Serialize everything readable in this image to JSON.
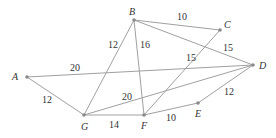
{
  "diagram": {
    "type": "weighted-undirected-graph",
    "nodes": [
      {
        "id": "A",
        "x": 27,
        "y": 77,
        "lx": 12,
        "ly": 80
      },
      {
        "id": "B",
        "x": 134,
        "y": 20,
        "lx": 129,
        "ly": 15
      },
      {
        "id": "C",
        "x": 220,
        "y": 30,
        "lx": 224,
        "ly": 28
      },
      {
        "id": "D",
        "x": 253,
        "y": 65,
        "lx": 259,
        "ly": 69
      },
      {
        "id": "E",
        "x": 198,
        "y": 103,
        "lx": 195,
        "ly": 117
      },
      {
        "id": "F",
        "x": 144,
        "y": 115,
        "lx": 141,
        "ly": 129
      },
      {
        "id": "G",
        "x": 84,
        "y": 115,
        "lx": 81,
        "ly": 130
      }
    ],
    "edges": [
      {
        "from": "A",
        "to": "D",
        "weight": "20",
        "wx": 70,
        "wy": 71
      },
      {
        "from": "A",
        "to": "G",
        "weight": "12",
        "wx": 42,
        "wy": 103
      },
      {
        "from": "B",
        "to": "C",
        "weight": "10",
        "wx": 177,
        "wy": 20
      },
      {
        "from": "B",
        "to": "D",
        "weight": "15",
        "wx": 223,
        "wy": 51
      },
      {
        "from": "B",
        "to": "G",
        "weight": "12",
        "wx": 108,
        "wy": 48
      },
      {
        "from": "B",
        "to": "F",
        "weight": "16",
        "wx": 140,
        "wy": 48
      },
      {
        "from": "C",
        "to": "F",
        "weight": "15",
        "wx": 186,
        "wy": 61
      },
      {
        "from": "G",
        "to": "D",
        "weight": "20",
        "wx": 122,
        "wy": 100
      },
      {
        "from": "G",
        "to": "F",
        "weight": "14",
        "wx": 109,
        "wy": 128
      },
      {
        "from": "F",
        "to": "E",
        "weight": "10",
        "wx": 166,
        "wy": 121
      },
      {
        "from": "E",
        "to": "D",
        "weight": "12",
        "wx": 224,
        "wy": 95
      }
    ]
  }
}
